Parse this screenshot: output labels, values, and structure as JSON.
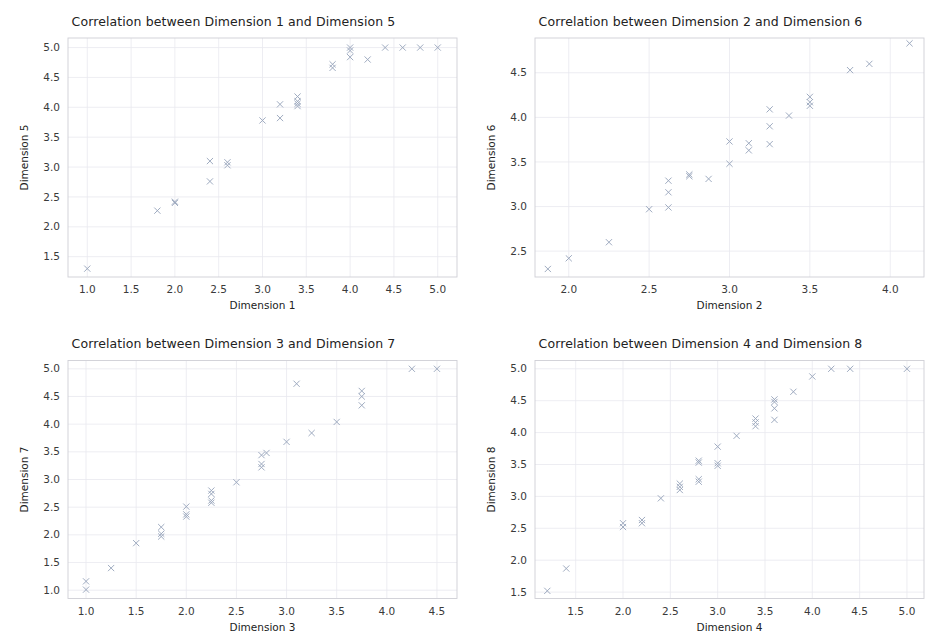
{
  "figure": {
    "width": 934,
    "height": 643,
    "background": "#ffffff",
    "marker_color": "#9aa7bd",
    "grid_color": "#e9e9ef",
    "spine_color": "#cfcfd6",
    "title_color": "#222222",
    "marker_symbol": "x"
  },
  "panels": [
    {
      "id": "panel-dim1-dim5",
      "title": "Correlation between Dimension 1 and Dimension 5",
      "xlabel": "Dimension 1",
      "ylabel": "Dimension 5"
    },
    {
      "id": "panel-dim2-dim6",
      "title": "Correlation between Dimension 2 and Dimension 6",
      "xlabel": "Dimension 2",
      "ylabel": "Dimension 6"
    },
    {
      "id": "panel-dim3-dim7",
      "title": "Correlation between Dimension 3 and Dimension 7",
      "xlabel": "Dimension 3",
      "ylabel": "Dimension 7"
    },
    {
      "id": "panel-dim4-dim8",
      "title": "Correlation between Dimension 4 and Dimension 8",
      "xlabel": "Dimension 4",
      "ylabel": "Dimension 8"
    }
  ],
  "chart_data": [
    {
      "type": "scatter",
      "title": "Correlation between Dimension 1 and Dimension 5",
      "xlabel": "Dimension 1",
      "ylabel": "Dimension 5",
      "xticks": [
        1.0,
        1.5,
        2.0,
        2.5,
        3.0,
        3.5,
        4.0,
        4.5,
        5.0
      ],
      "yticks": [
        1.5,
        2.0,
        2.5,
        3.0,
        3.5,
        4.0,
        4.5,
        5.0
      ],
      "xtick_labels": [
        "1.0",
        "1.5",
        "2.0",
        "2.5",
        "3.0",
        "3.5",
        "4.0",
        "4.5",
        "5.0"
      ],
      "ytick_labels": [
        "1.5",
        "2.0",
        "2.5",
        "3.0",
        "3.5",
        "4.0",
        "4.5",
        "5.0"
      ],
      "xlim": [
        0.78,
        5.22
      ],
      "ylim": [
        1.16,
        5.16
      ],
      "grid": true,
      "legend": "none",
      "marker": "x",
      "points": [
        [
          1.0,
          1.3
        ],
        [
          1.8,
          2.27
        ],
        [
          2.0,
          2.42
        ],
        [
          2.0,
          2.4
        ],
        [
          2.4,
          2.76
        ],
        [
          2.4,
          3.1
        ],
        [
          2.6,
          3.08
        ],
        [
          2.6,
          3.03
        ],
        [
          3.0,
          3.78
        ],
        [
          3.2,
          3.82
        ],
        [
          3.2,
          4.05
        ],
        [
          3.4,
          4.18
        ],
        [
          3.4,
          4.1
        ],
        [
          3.4,
          4.06
        ],
        [
          3.4,
          4.02
        ],
        [
          3.8,
          4.66
        ],
        [
          3.8,
          4.72
        ],
        [
          4.0,
          4.95
        ],
        [
          4.0,
          4.84
        ],
        [
          4.2,
          4.8
        ],
        [
          4.0,
          5.0
        ],
        [
          4.4,
          5.0
        ],
        [
          4.6,
          5.0
        ],
        [
          4.8,
          5.0
        ],
        [
          5.0,
          5.0
        ]
      ]
    },
    {
      "type": "scatter",
      "title": "Correlation between Dimension 2 and Dimension 6",
      "xlabel": "Dimension 2",
      "ylabel": "Dimension 6",
      "xticks": [
        2.0,
        2.5,
        3.0,
        3.5,
        4.0
      ],
      "yticks": [
        2.5,
        3.0,
        3.5,
        4.0,
        4.5
      ],
      "xtick_labels": [
        "2.0",
        "2.5",
        "3.0",
        "3.5",
        "4.0"
      ],
      "ytick_labels": [
        "2.5",
        "3.0",
        "3.5",
        "4.0",
        "4.5"
      ],
      "xlim": [
        1.79,
        4.21
      ],
      "ylim": [
        2.21,
        4.89
      ],
      "grid": true,
      "legend": "none",
      "marker": "x",
      "points": [
        [
          1.87,
          2.3
        ],
        [
          2.0,
          2.42
        ],
        [
          2.25,
          2.6
        ],
        [
          2.5,
          2.97
        ],
        [
          2.62,
          2.99
        ],
        [
          2.62,
          3.16
        ],
        [
          2.62,
          3.29
        ],
        [
          2.75,
          3.36
        ],
        [
          2.75,
          3.34
        ],
        [
          2.87,
          3.31
        ],
        [
          3.0,
          3.48
        ],
        [
          3.0,
          3.73
        ],
        [
          3.12,
          3.63
        ],
        [
          3.12,
          3.71
        ],
        [
          3.25,
          3.7
        ],
        [
          3.25,
          3.9
        ],
        [
          3.25,
          4.09
        ],
        [
          3.37,
          4.02
        ],
        [
          3.5,
          4.13
        ],
        [
          3.5,
          4.17
        ],
        [
          3.5,
          4.23
        ],
        [
          3.75,
          4.53
        ],
        [
          3.87,
          4.6
        ],
        [
          4.12,
          4.83
        ]
      ]
    },
    {
      "type": "scatter",
      "title": "Correlation between Dimension 3 and Dimension 7",
      "xlabel": "Dimension 3",
      "ylabel": "Dimension 7",
      "xticks": [
        1.0,
        1.5,
        2.0,
        2.5,
        3.0,
        3.5,
        4.0,
        4.5
      ],
      "yticks": [
        1.0,
        1.5,
        2.0,
        2.5,
        3.0,
        3.5,
        4.0,
        4.5,
        5.0
      ],
      "xtick_labels": [
        "1.0",
        "1.5",
        "2.0",
        "2.5",
        "3.0",
        "3.5",
        "4.0",
        "4.5"
      ],
      "ytick_labels": [
        "1.0",
        "1.5",
        "2.0",
        "2.5",
        "3.0",
        "3.5",
        "4.0",
        "4.5",
        "5.0"
      ],
      "xlim": [
        0.82,
        4.7
      ],
      "ylim": [
        0.85,
        5.15
      ],
      "grid": true,
      "legend": "none",
      "marker": "x",
      "points": [
        [
          1.0,
          1.01
        ],
        [
          1.0,
          1.16
        ],
        [
          1.25,
          1.4
        ],
        [
          1.5,
          1.85
        ],
        [
          1.75,
          1.97
        ],
        [
          1.75,
          2.02
        ],
        [
          1.75,
          2.14
        ],
        [
          2.0,
          2.33
        ],
        [
          2.0,
          2.37
        ],
        [
          2.0,
          2.51
        ],
        [
          2.25,
          2.58
        ],
        [
          2.25,
          2.62
        ],
        [
          2.25,
          2.74
        ],
        [
          2.25,
          2.8
        ],
        [
          2.5,
          2.95
        ],
        [
          2.75,
          3.22
        ],
        [
          2.75,
          3.28
        ],
        [
          2.75,
          3.44
        ],
        [
          2.8,
          3.48
        ],
        [
          3.0,
          3.68
        ],
        [
          3.1,
          4.73
        ],
        [
          3.25,
          3.84
        ],
        [
          3.5,
          4.04
        ],
        [
          3.75,
          4.34
        ],
        [
          3.75,
          4.5
        ],
        [
          3.75,
          4.6
        ],
        [
          4.25,
          5.0
        ],
        [
          4.5,
          5.0
        ]
      ]
    },
    {
      "type": "scatter",
      "title": "Correlation between Dimension 4 and Dimension 8",
      "xlabel": "Dimension 4",
      "ylabel": "Dimension 8",
      "xticks": [
        1.5,
        2.0,
        2.5,
        3.0,
        3.5,
        4.0,
        4.5,
        5.0
      ],
      "yticks": [
        1.5,
        2.0,
        2.5,
        3.0,
        3.5,
        4.0,
        4.5,
        5.0
      ],
      "xtick_labels": [
        "1.5",
        "2.0",
        "2.5",
        "3.0",
        "3.5",
        "4.0",
        "4.5",
        "5.0"
      ],
      "ytick_labels": [
        "1.5",
        "2.0",
        "2.5",
        "3.0",
        "3.5",
        "4.0",
        "4.5",
        "5.0"
      ],
      "xlim": [
        1.07,
        5.18
      ],
      "ylim": [
        1.4,
        5.13
      ],
      "grid": true,
      "legend": "none",
      "marker": "x",
      "points": [
        [
          1.2,
          1.52
        ],
        [
          1.4,
          1.87
        ],
        [
          2.0,
          2.52
        ],
        [
          2.0,
          2.58
        ],
        [
          2.2,
          2.58
        ],
        [
          2.2,
          2.63
        ],
        [
          2.4,
          2.97
        ],
        [
          2.6,
          3.1
        ],
        [
          2.6,
          3.15
        ],
        [
          2.6,
          3.2
        ],
        [
          2.8,
          3.23
        ],
        [
          2.8,
          3.27
        ],
        [
          2.8,
          3.53
        ],
        [
          2.8,
          3.56
        ],
        [
          3.0,
          3.48
        ],
        [
          3.0,
          3.52
        ],
        [
          3.0,
          3.78
        ],
        [
          3.2,
          3.95
        ],
        [
          3.4,
          4.1
        ],
        [
          3.4,
          4.16
        ],
        [
          3.4,
          4.22
        ],
        [
          3.6,
          4.2
        ],
        [
          3.6,
          4.38
        ],
        [
          3.6,
          4.48
        ],
        [
          3.6,
          4.52
        ],
        [
          3.8,
          4.64
        ],
        [
          4.0,
          4.88
        ],
        [
          4.2,
          5.0
        ],
        [
          4.4,
          5.0
        ],
        [
          5.0,
          5.0
        ]
      ]
    }
  ]
}
